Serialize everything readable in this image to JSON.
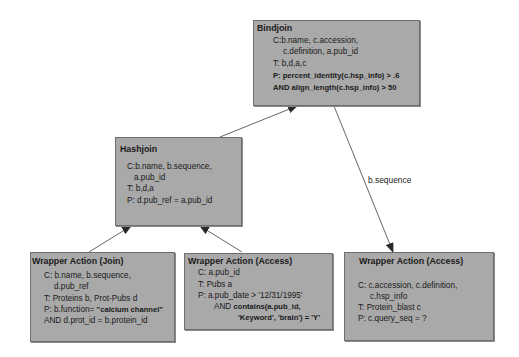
{
  "nodes": {
    "bindjoin": {
      "title": "Bindjoin",
      "lines": [
        "C:b.name, c.accession,",
        "c.definition, a.pub_id",
        "T: b,d,a,c",
        "P: percent_identity(c.hsp_info) > .6",
        "AND align_length(c.hsp_info) > 50"
      ]
    },
    "hashjoin": {
      "title": "Hashjoin",
      "lines": [
        "C:b.name, b.sequence,",
        "a.pub_id",
        "T: b,d,a",
        "P: d.pub_ref = a.pub_id"
      ]
    },
    "wrapper_join": {
      "title": "Wrapper Action (Join)",
      "lines": [
        "C: b.name, b.sequence,",
        "d.pub_ref",
        "T: Proteins b, Prot-Pubs d",
        "P: b.function= ",
        "\"calcium channel\"",
        "AND d.prot_id = b.protein_id"
      ]
    },
    "wrapper_access_pubs": {
      "title": "Wrapper Action (Access)",
      "lines": [
        "C: a.pub_id",
        "T: Pubs a",
        "P: a.pub_date > '12/31/1995'",
        "AND ",
        "contains(a.pub_id,",
        "'Keyword', 'brain') = 'Y'"
      ]
    },
    "wrapper_access_blast": {
      "title": "Wrapper Action (Access)",
      "lines": [
        "C: c.accession, c.definition,",
        "c.hsp_info",
        "T: Protein_blast c",
        "P: c.query_seq = ?"
      ]
    }
  },
  "edges": [
    {
      "from": "hashjoin",
      "to": "bindjoin",
      "label": ""
    },
    {
      "from": "bindjoin",
      "to": "wrapper_access_blast",
      "label": "b.sequence"
    },
    {
      "from": "wrapper_join",
      "to": "hashjoin",
      "label": ""
    },
    {
      "from": "wrapper_access_pubs",
      "to": "hashjoin",
      "label": ""
    }
  ],
  "colors": {
    "node_fill": "#a9a9a9",
    "node_border": "#6e6e6e",
    "edge": "#555555",
    "text": "#1a1a1a"
  }
}
